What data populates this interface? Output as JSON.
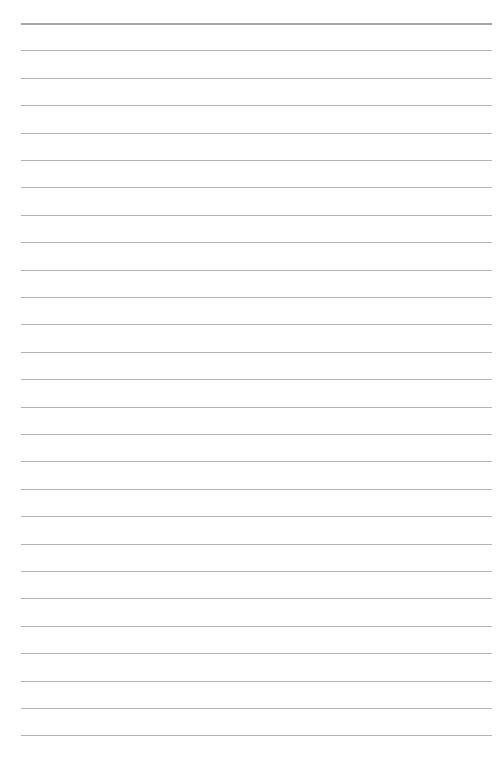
{
  "page": {
    "type": "ruled-paper",
    "background_color": "#ffffff",
    "rule_color": "#b4b4b4",
    "top_rule_color": "#a6a6a6",
    "rule_count": 27,
    "first_rule_y": 23,
    "rule_spacing": 27.4,
    "rule_left": 21,
    "rule_right": 492
  }
}
